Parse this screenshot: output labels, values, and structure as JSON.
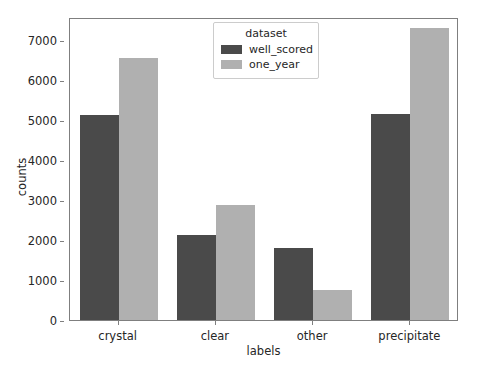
{
  "chart_data": {
    "type": "bar",
    "title": "",
    "xlabel": "labels",
    "ylabel": "counts",
    "categories": [
      "crystal",
      "clear",
      "other",
      "precipitate"
    ],
    "series": [
      {
        "name": "well_scored",
        "color": "#4a4a4a",
        "values": [
          5000,
          2080,
          1750,
          5020
        ]
      },
      {
        "name": "one_year",
        "color": "#b0b0b0",
        "values": [
          6400,
          2800,
          740,
          7130
        ]
      }
    ],
    "ylim": [
      0,
      7400
    ],
    "yticks": [
      0,
      1000,
      2000,
      3000,
      4000,
      5000,
      6000,
      7000
    ],
    "ytick_labels": [
      "0",
      "1000",
      "2000",
      "3000",
      "4000",
      "5000",
      "6000",
      "7000"
    ],
    "grid": false,
    "legend": {
      "title": "dataset",
      "position": "upper center",
      "entries": [
        "well_scored",
        "one_year"
      ]
    }
  }
}
